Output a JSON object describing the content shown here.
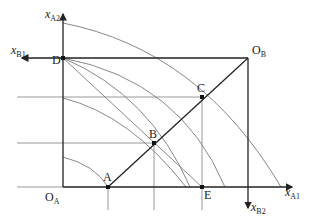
{
  "diagram": {
    "type": "edgeworth-box",
    "colors": {
      "axis": "#222222",
      "curve": "#7a7a7a",
      "guide": "#8c8c8c",
      "point": "#111111"
    },
    "axes": {
      "x_A1": {
        "main": "x",
        "sub": "A1"
      },
      "x_A2": {
        "main": "x",
        "sub": "A2"
      },
      "x_B1": {
        "main": "x",
        "sub": "B1"
      },
      "x_B2": {
        "main": "x",
        "sub": "B2"
      }
    },
    "origins": {
      "O_A": {
        "main": "O",
        "sub": "A"
      },
      "O_B": {
        "main": "O",
        "sub": "B"
      }
    },
    "points": {
      "A": "A",
      "B": "B",
      "C": "C",
      "D": "D",
      "E": "E"
    }
  }
}
